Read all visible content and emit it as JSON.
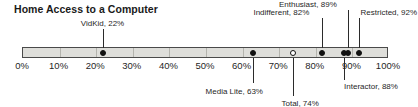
{
  "chart_data": {
    "type": "scatter",
    "title": "Home Access to a Computer",
    "xlabel": "",
    "ylabel": "",
    "xlim": [
      0,
      100
    ],
    "grid": false,
    "legend_position": "none",
    "axis_tick_labels": [
      "0%",
      "10%",
      "20%",
      "30%",
      "40%",
      "50%",
      "60%",
      "70%",
      "80%",
      "90%",
      "100%"
    ],
    "axis_tick_values": [
      0,
      10,
      20,
      30,
      40,
      50,
      60,
      70,
      80,
      90,
      100
    ],
    "categories": [
      "VidKid",
      "Media Lite",
      "Total",
      "Indifferent",
      "Enthusiast",
      "Interactor",
      "Restricted"
    ],
    "values": [
      22,
      63,
      74,
      82,
      89,
      88,
      92
    ],
    "points": [
      {
        "name": "VidKid",
        "label": "VidKid, 22%",
        "value": 22,
        "marker": "filled",
        "label_position": "above",
        "anchor": "center",
        "label_x": 22,
        "label_y": 20,
        "leader_top": 29,
        "leader_height": 19
      },
      {
        "name": "Media Lite",
        "label": "Media Lite, 63%",
        "value": 63,
        "marker": "filled",
        "label_position": "below",
        "anchor": "center",
        "label_x": 58,
        "label_y": 88,
        "leader_top": 58,
        "leader_height": 25
      },
      {
        "name": "Total",
        "label": "Total, 74%",
        "value": 74,
        "marker": "open",
        "label_position": "below",
        "anchor": "center",
        "label_x": 76,
        "label_y": 100,
        "leader_top": 58,
        "leader_height": 38
      },
      {
        "name": "Indifferent",
        "label": "Indifferent, 82%",
        "value": 82,
        "marker": "filled",
        "label_position": "above",
        "anchor": "end",
        "label_x": 78.5,
        "label_y": 9,
        "leader_top": 18,
        "leader_height": 30
      },
      {
        "name": "Enthusiast",
        "label": "Enthusiast, 89%",
        "value": 89,
        "marker": "filled",
        "label_position": "above",
        "anchor": "end",
        "label_x": 86,
        "label_y": 1,
        "leader_top": 10,
        "leader_height": 38
      },
      {
        "name": "Interactor",
        "label": "Interactor, 88%",
        "value": 88,
        "marker": "filled",
        "label_position": "below",
        "anchor": "start",
        "label_x": 88,
        "label_y": 83,
        "leader_top": 58,
        "leader_height": 22
      },
      {
        "name": "Restricted",
        "label": "Restricted, 92%",
        "value": 92,
        "marker": "filled",
        "label_position": "above",
        "anchor": "start",
        "label_x": 92.5,
        "label_y": 9,
        "leader_top": 18,
        "leader_height": 30
      }
    ],
    "colors": {
      "bar_fill": "#dededa",
      "bar_border": "#4a4a4a",
      "marker": "#111111",
      "text": "#1f1f1f",
      "title": "#1a1a1a"
    }
  }
}
